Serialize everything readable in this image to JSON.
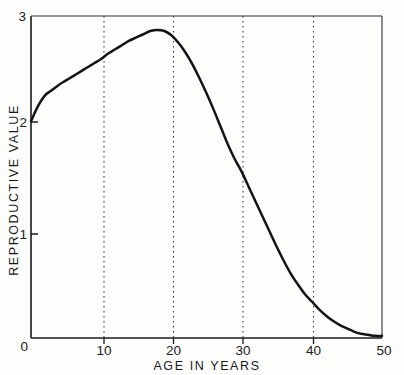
{
  "figure": {
    "background_color": "#fdfdfc",
    "ink_color": "#1a1a1d",
    "curve_color": "#141417",
    "gridline_color": "#3a3a3d"
  },
  "chart_data": {
    "type": "line",
    "title": "",
    "xlabel": "AGE IN YEARS",
    "ylabel": "REPRODUCTIVE VALUE",
    "xlim": [
      0,
      50
    ],
    "ylim": [
      0,
      3
    ],
    "xticks": [
      0,
      10,
      20,
      30,
      40,
      50
    ],
    "xtick_labels": [
      "0",
      "10",
      "20",
      "30",
      "40",
      "50"
    ],
    "yticks": [
      0,
      1,
      2,
      3
    ],
    "ytick_labels": [
      "0",
      "1",
      "2",
      "3"
    ],
    "grid": "vertical dotted gridlines at x = 10, 20, 30, 40",
    "gridlines_x": [
      10,
      20,
      30,
      40
    ],
    "legend": null,
    "series": [
      {
        "name": "Reproductive value",
        "x": [
          0,
          1,
          2,
          3,
          4,
          5,
          6,
          7,
          8,
          9,
          10,
          11,
          12,
          13,
          14,
          15,
          16,
          17,
          18,
          19,
          20,
          21,
          22,
          23,
          24,
          25,
          26,
          27,
          28,
          29,
          30,
          31,
          32,
          33,
          34,
          35,
          36,
          37,
          38,
          39,
          40,
          41,
          42,
          43,
          44,
          45,
          46,
          47,
          48,
          49,
          50
        ],
        "values": [
          2.02,
          2.16,
          2.26,
          2.31,
          2.36,
          2.4,
          2.44,
          2.48,
          2.52,
          2.56,
          2.6,
          2.65,
          2.69,
          2.73,
          2.77,
          2.8,
          2.83,
          2.86,
          2.87,
          2.86,
          2.82,
          2.75,
          2.66,
          2.55,
          2.42,
          2.28,
          2.13,
          1.97,
          1.81,
          1.67,
          1.55,
          1.41,
          1.27,
          1.13,
          0.99,
          0.85,
          0.72,
          0.6,
          0.5,
          0.41,
          0.34,
          0.27,
          0.21,
          0.16,
          0.12,
          0.09,
          0.06,
          0.04,
          0.03,
          0.02,
          0.02
        ]
      }
    ],
    "annotations": {
      "peak_age": 18,
      "peak_value": 2.87,
      "birth_value": 2.02
    }
  },
  "axes": {
    "y_axis_label": "REPRODUCTIVE VALUE",
    "x_axis_label": "AGE IN YEARS",
    "y_tick_3": "3",
    "y_tick_2": "2",
    "y_tick_1": "1",
    "y_tick_0": "0",
    "x_tick_0": "0",
    "x_tick_10": "10",
    "x_tick_20": "20",
    "x_tick_30": "30",
    "x_tick_40": "40",
    "x_tick_50": "50"
  }
}
